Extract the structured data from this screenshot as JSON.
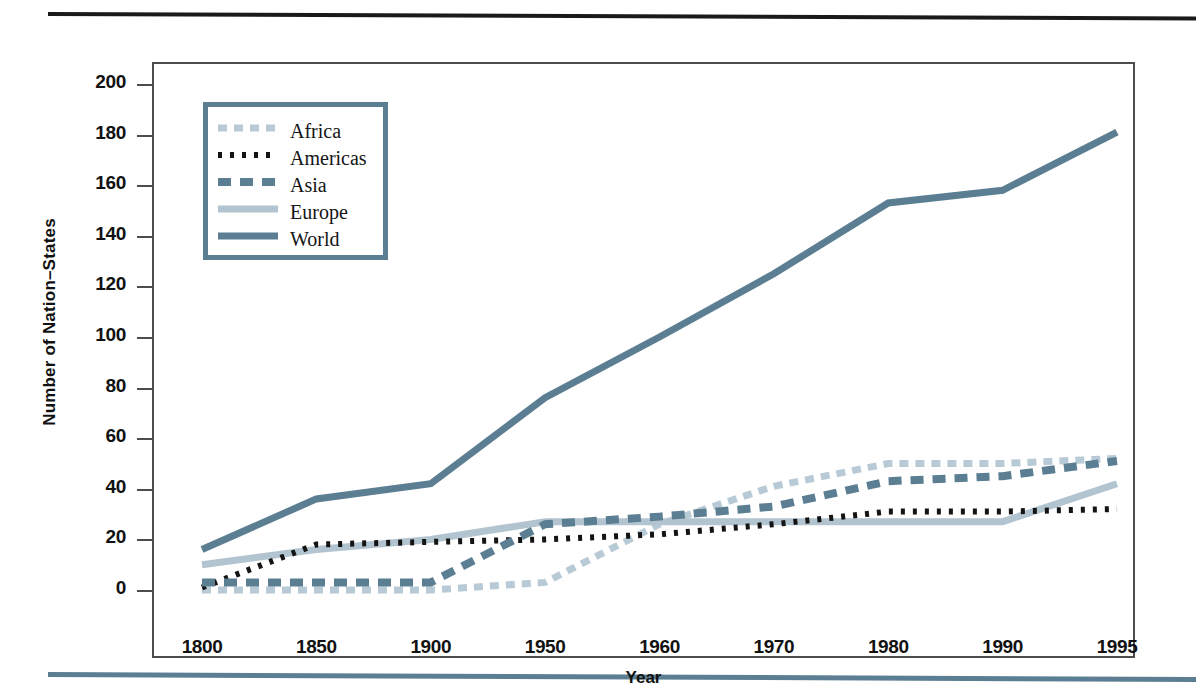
{
  "figure": {
    "y_axis_label": "Number of Nation–States",
    "x_axis_label": "Year"
  },
  "legend": {
    "entries": [
      {
        "label": "Africa",
        "style": "dashed-light",
        "color": "#9bb4c4"
      },
      {
        "label": "Americas",
        "style": "dotted-dark",
        "color": "#1a1a1a"
      },
      {
        "label": "Asia",
        "style": "dashed-blue",
        "color": "#5b7e93"
      },
      {
        "label": "Europe",
        "style": "solid-light",
        "color": "#b2c4d0"
      },
      {
        "label": "World",
        "style": "solid-dark",
        "color": "#5b7e93"
      }
    ]
  },
  "chart_data": {
    "type": "line",
    "title": "",
    "xlabel": "Year",
    "ylabel": "Number of Nation–States",
    "categories": [
      "1800",
      "1850",
      "1900",
      "1950",
      "1960",
      "1970",
      "1980",
      "1990",
      "1995"
    ],
    "yticks": [
      0,
      20,
      40,
      60,
      80,
      100,
      120,
      140,
      160,
      180,
      200
    ],
    "ylim": [
      0,
      200
    ],
    "grid": false,
    "legend_position": "upper-left-inside",
    "series": [
      {
        "name": "Africa",
        "values": [
          0,
          0,
          0,
          3,
          26,
          41,
          50,
          50,
          52
        ]
      },
      {
        "name": "Americas",
        "values": [
          1,
          18,
          19,
          20,
          22,
          26,
          31,
          31,
          32
        ]
      },
      {
        "name": "Asia",
        "values": [
          3,
          3,
          3,
          26,
          29,
          33,
          43,
          45,
          51
        ]
      },
      {
        "name": "Europe",
        "values": [
          10,
          16,
          20,
          27,
          27,
          27,
          27,
          27,
          42
        ]
      },
      {
        "name": "World",
        "values": [
          16,
          36,
          42,
          76,
          100,
          125,
          153,
          158,
          181
        ]
      }
    ]
  }
}
